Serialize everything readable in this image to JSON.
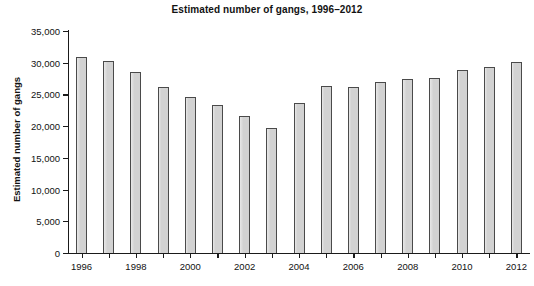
{
  "chart_data": {
    "type": "bar",
    "title": "Estimated number of gangs, 1996–2012",
    "xlabel": "",
    "ylabel": "Estimated number of gangs",
    "categories": [
      "1996",
      "1997",
      "1998",
      "1999",
      "2000",
      "2001",
      "2002",
      "2003",
      "2004",
      "2005",
      "2006",
      "2007",
      "2008",
      "2009",
      "2010",
      "2011",
      "2012"
    ],
    "values": [
      30900,
      30300,
      28500,
      26100,
      24600,
      23300,
      21600,
      19700,
      23700,
      26300,
      26200,
      26900,
      27400,
      27600,
      28900,
      29300,
      30100
    ],
    "ylim": [
      0,
      35000
    ],
    "ytick_values": [
      0,
      5000,
      10000,
      15000,
      20000,
      25000,
      30000,
      35000
    ],
    "ytick_labels": [
      "0",
      "5,000",
      "10,000",
      "15,000",
      "20,000",
      "25,000",
      "30,000",
      "35,000"
    ],
    "xtick_labels": [
      "1996",
      "1998",
      "2000",
      "2002",
      "2004",
      "2006",
      "2008",
      "2010",
      "2012"
    ],
    "grid": false,
    "legend": null,
    "bar_color": "#d2d2d2",
    "bar_edge_color": "#4a4a4a",
    "axis_color": "#1a1a1a"
  }
}
